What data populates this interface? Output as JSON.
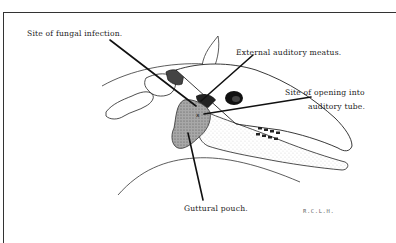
{
  "diagram": {
    "labels": {
      "fungal_infection": "Site of fungal infection.",
      "external_auditory_meatus": "External auditory meatus.",
      "opening_line1": "Site of opening into",
      "opening_line2": "auditory tube.",
      "guttural_pouch": "Guttural pouch.",
      "signature": "R.C.L.H."
    },
    "marker": "x",
    "colors": {
      "line": "#111111",
      "pouch_fill": "#8c8c8c",
      "frame": "#333333",
      "background": "#ffffff"
    }
  }
}
